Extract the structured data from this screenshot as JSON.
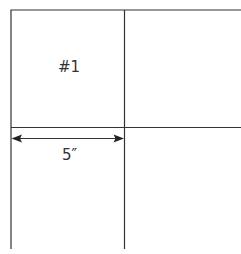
{
  "diagram": {
    "panel_label": "#1",
    "dimension_label": "5″",
    "line_color": "#333333"
  }
}
